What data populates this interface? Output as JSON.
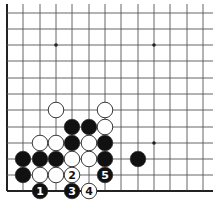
{
  "diagram": {
    "type": "go-board-corner",
    "colors": {
      "line": "#555555",
      "edge": "#222222",
      "black": "#111111",
      "white": "#ffffff",
      "stone_outline": "#222222"
    },
    "grid": {
      "columns_x": [
        7,
        23,
        40,
        56,
        72,
        89,
        105,
        121,
        138,
        154,
        170,
        187,
        203
      ],
      "rows_y": [
        13,
        29,
        45,
        61,
        78,
        94,
        110,
        127,
        143,
        159,
        175,
        191
      ],
      "left_edge": true,
      "bottom_edge": true,
      "right_extent": 213,
      "top_extent": 4
    },
    "star_points": [
      {
        "col": 3,
        "row": 2
      },
      {
        "col": 9,
        "row": 2
      },
      {
        "col": 9,
        "row": 8
      }
    ],
    "stones": [
      {
        "color": "white",
        "col": 3,
        "row": 6
      },
      {
        "color": "white",
        "col": 6,
        "row": 6
      },
      {
        "color": "black",
        "col": 4,
        "row": 7
      },
      {
        "color": "black",
        "col": 5,
        "row": 7
      },
      {
        "color": "white",
        "col": 6,
        "row": 7
      },
      {
        "color": "white",
        "col": 2,
        "row": 8
      },
      {
        "color": "white",
        "col": 3,
        "row": 8
      },
      {
        "color": "black",
        "col": 4,
        "row": 8
      },
      {
        "color": "white",
        "col": 5,
        "row": 8
      },
      {
        "color": "black",
        "col": 6,
        "row": 8
      },
      {
        "color": "black",
        "col": 1,
        "row": 9
      },
      {
        "color": "black",
        "col": 2,
        "row": 9
      },
      {
        "color": "black",
        "col": 3,
        "row": 9
      },
      {
        "color": "white",
        "col": 4,
        "row": 9
      },
      {
        "color": "white",
        "col": 5,
        "row": 9
      },
      {
        "color": "black",
        "col": 6,
        "row": 9
      },
      {
        "color": "black",
        "col": 8,
        "row": 9
      },
      {
        "color": "black",
        "col": 1,
        "row": 10
      },
      {
        "color": "white",
        "col": 2,
        "row": 10
      },
      {
        "color": "white",
        "col": 3,
        "row": 10
      },
      {
        "color": "white",
        "col": 4,
        "row": 10,
        "label": "2"
      },
      {
        "color": "black",
        "col": 6,
        "row": 10,
        "label": "5"
      },
      {
        "color": "black",
        "col": 2,
        "row": 11,
        "label": "1"
      },
      {
        "color": "black",
        "col": 4,
        "row": 11,
        "label": "3"
      },
      {
        "color": "white",
        "col": 5,
        "row": 11,
        "label": "4"
      }
    ]
  }
}
